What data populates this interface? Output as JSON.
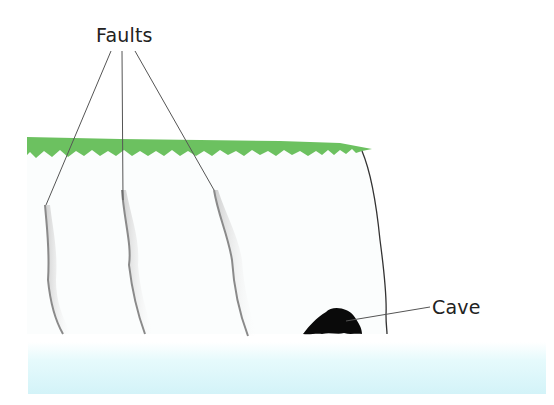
{
  "diagram": {
    "labels": {
      "faults": "Faults",
      "cave": "Cave"
    },
    "colors": {
      "grass": "#6cc160",
      "cliff_shade": "#9a9a9a",
      "leader_line": "#555555",
      "cave": "#0a0a0a",
      "sea": "#dff7fb",
      "background": "#ffffff"
    },
    "elements": [
      {
        "name": "grass-top",
        "type": "grass strip along cliff top"
      },
      {
        "name": "fault-1",
        "type": "vertical fault crack"
      },
      {
        "name": "fault-2",
        "type": "vertical fault crack"
      },
      {
        "name": "fault-3",
        "type": "vertical fault crack"
      },
      {
        "name": "cliff-face",
        "type": "cliff edge line"
      },
      {
        "name": "cave",
        "type": "sea cave at cliff base"
      },
      {
        "name": "sea",
        "type": "sea band"
      }
    ]
  }
}
